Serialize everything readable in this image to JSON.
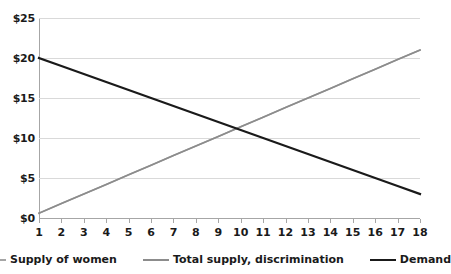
{
  "chart_data": {
    "type": "line",
    "title": "",
    "xlabel": "",
    "ylabel": "",
    "grid": true,
    "legend_position": "bottom",
    "categories": [
      1,
      2,
      3,
      4,
      5,
      6,
      7,
      8,
      9,
      10,
      11,
      12,
      13,
      14,
      15,
      16,
      17,
      18
    ],
    "x_tick_labels": [
      "1",
      "2",
      "3",
      "4",
      "5",
      "6",
      "7",
      "8",
      "9",
      "10",
      "11",
      "12",
      "13",
      "14",
      "15",
      "16",
      "17",
      "18"
    ],
    "y_tick_labels": [
      "$0",
      "$5",
      "$10",
      "$15",
      "$20",
      "$25"
    ],
    "y_tick_values": [
      0,
      5,
      10,
      15,
      20,
      25
    ],
    "ylim": [
      0,
      25
    ],
    "xlim": [
      1,
      18
    ],
    "series": [
      {
        "name": "Supply of women",
        "color": "#a5a5a5",
        "width": 1.6,
        "values": [
          0.6,
          1.8,
          3.0,
          4.2,
          5.4,
          6.6,
          7.8,
          9.0,
          10.2,
          11.4,
          12.6,
          13.8,
          15.0,
          16.2,
          17.4,
          18.6,
          19.8,
          21.0
        ]
      },
      {
        "name": "Total supply, discrimination",
        "color": "#8c8c8c",
        "width": 1.6,
        "values": [
          0.6,
          1.8,
          3.0,
          4.2,
          5.4,
          6.6,
          7.8,
          9.0,
          10.2,
          11.4,
          12.6,
          13.8,
          15.0,
          16.2,
          17.4,
          18.6,
          19.8,
          21.0
        ]
      },
      {
        "name": "Demand",
        "color": "#1a1a1a",
        "width": 2.2,
        "values": [
          20.0,
          19.0,
          18.0,
          17.0,
          16.0,
          15.0,
          14.0,
          13.0,
          12.0,
          11.0,
          10.0,
          9.0,
          8.0,
          7.0,
          6.0,
          5.0,
          4.0,
          3.0
        ]
      }
    ]
  },
  "legend": {
    "items": [
      {
        "label": "Supply of women",
        "color": "#a5a5a5",
        "width": 2
      },
      {
        "label": "Total supply, discrimination",
        "color": "#8c8c8c",
        "width": 2
      },
      {
        "label": "Demand",
        "color": "#1a1a1a",
        "width": 2.6
      }
    ]
  },
  "colors": {
    "background": "#ffffff",
    "gridline": "#d9d9d9",
    "axis": "#a6a6a6",
    "tick_label": "#1a1a1a"
  }
}
